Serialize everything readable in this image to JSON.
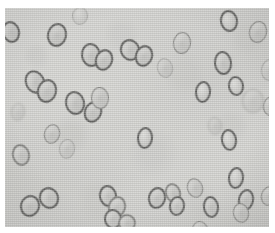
{
  "image": {
    "kind": "light-microscopy-micrograph",
    "subject": "ellipsoidal cells with dark refractive rims and pale centers, several in budding pairs",
    "width": 275,
    "height": 233,
    "canvas_background": "#ffffff"
  },
  "field": {
    "label": "specimen-field",
    "x": 5,
    "y": 8,
    "width": 264,
    "height": 219,
    "background_color": "#cdcdca",
    "highlight_color": "#d6d6d2",
    "shadow_color": "#c2c2bf",
    "texture": "horizontal-scan-lines"
  },
  "cell_style": {
    "rim_color": "#555553",
    "rim_color_soft": "#7c7c79",
    "rim_color_faint": "#9a9a97",
    "body_color": "#c6c6c3",
    "body_highlight": "#dcdcd9",
    "core_color": "#b6b6b3"
  },
  "cells": [
    {
      "id": "c01",
      "cx": 6,
      "cy": 24,
      "rx": 9,
      "ry": 11,
      "rot": -15,
      "rim": 2.0,
      "tone": "dark",
      "core": true
    },
    {
      "id": "c02",
      "cx": 52,
      "cy": 27,
      "rx": 10,
      "ry": 12,
      "rot": 12,
      "rim": 2.0,
      "tone": "dark",
      "core": true
    },
    {
      "id": "c03",
      "cx": 125,
      "cy": 42,
      "rx": 10,
      "ry": 11,
      "rot": -20,
      "rim": 2.0,
      "tone": "dark",
      "core": true
    },
    {
      "id": "c04",
      "cx": 139,
      "cy": 48,
      "rx": 9,
      "ry": 11,
      "rot": 18,
      "rim": 2.0,
      "tone": "dark",
      "core": true
    },
    {
      "id": "c05",
      "cx": 177,
      "cy": 35,
      "rx": 9,
      "ry": 11,
      "rot": 8,
      "rim": 1.8,
      "tone": "mid",
      "core": true
    },
    {
      "id": "c06",
      "cx": 224,
      "cy": 13,
      "rx": 9,
      "ry": 11,
      "rot": -10,
      "rim": 2.0,
      "tone": "dark",
      "core": false
    },
    {
      "id": "c07",
      "cx": 253,
      "cy": 24,
      "rx": 9,
      "ry": 11,
      "rot": 14,
      "rim": 1.8,
      "tone": "mid",
      "core": true
    },
    {
      "id": "c08",
      "cx": 86,
      "cy": 47,
      "rx": 10,
      "ry": 12,
      "rot": -8,
      "rim": 2.2,
      "tone": "dark",
      "core": true
    },
    {
      "id": "c09",
      "cx": 99,
      "cy": 52,
      "rx": 9,
      "ry": 11,
      "rot": 20,
      "rim": 2.0,
      "tone": "dark",
      "core": true
    },
    {
      "id": "c10",
      "cx": 218,
      "cy": 55,
      "rx": 9,
      "ry": 12,
      "rot": -6,
      "rim": 2.2,
      "tone": "dark",
      "core": true
    },
    {
      "id": "c11",
      "cx": 265,
      "cy": 62,
      "rx": 9,
      "ry": 11,
      "rot": 10,
      "rim": 1.6,
      "tone": "faint",
      "core": true
    },
    {
      "id": "c12",
      "cx": 30,
      "cy": 74,
      "rx": 10,
      "ry": 12,
      "rot": -25,
      "rim": 2.2,
      "tone": "dark",
      "core": true
    },
    {
      "id": "c13",
      "cx": 42,
      "cy": 83,
      "rx": 10,
      "ry": 12,
      "rot": 15,
      "rim": 2.2,
      "tone": "dark",
      "core": true
    },
    {
      "id": "c14",
      "cx": 70,
      "cy": 95,
      "rx": 10,
      "ry": 12,
      "rot": -12,
      "rim": 2.0,
      "tone": "dark",
      "core": true
    },
    {
      "id": "c15",
      "cx": 88,
      "cy": 104,
      "rx": 9,
      "ry": 11,
      "rot": 22,
      "rim": 2.0,
      "tone": "dark",
      "core": true
    },
    {
      "id": "c16",
      "cx": 95,
      "cy": 90,
      "rx": 9,
      "ry": 11,
      "rot": -5,
      "rim": 1.8,
      "tone": "mid",
      "core": true
    },
    {
      "id": "c17",
      "cx": 198,
      "cy": 84,
      "rx": 8,
      "ry": 11,
      "rot": 6,
      "rim": 2.0,
      "tone": "dark",
      "core": false
    },
    {
      "id": "c18",
      "cx": 231,
      "cy": 78,
      "rx": 8,
      "ry": 10,
      "rot": -8,
      "rim": 2.0,
      "tone": "dark",
      "core": false
    },
    {
      "id": "c19",
      "cx": 266,
      "cy": 98,
      "rx": 8,
      "ry": 10,
      "rot": 12,
      "rim": 1.8,
      "tone": "mid",
      "core": true
    },
    {
      "id": "c20",
      "cx": 140,
      "cy": 130,
      "rx": 8,
      "ry": 11,
      "rot": 5,
      "rim": 2.0,
      "tone": "dark",
      "core": false
    },
    {
      "id": "c21",
      "cx": 224,
      "cy": 132,
      "rx": 8,
      "ry": 11,
      "rot": -9,
      "rim": 2.0,
      "tone": "dark",
      "core": false
    },
    {
      "id": "c22",
      "cx": 47,
      "cy": 126,
      "rx": 8,
      "ry": 10,
      "rot": 16,
      "rim": 1.8,
      "tone": "mid",
      "core": true
    },
    {
      "id": "c23",
      "cx": 16,
      "cy": 147,
      "rx": 9,
      "ry": 11,
      "rot": -14,
      "rim": 2.0,
      "tone": "mid",
      "core": true
    },
    {
      "id": "c24",
      "cx": 231,
      "cy": 170,
      "rx": 8,
      "ry": 11,
      "rot": 7,
      "rim": 2.0,
      "tone": "dark",
      "core": false
    },
    {
      "id": "c25",
      "cx": 190,
      "cy": 180,
      "rx": 8,
      "ry": 10,
      "rot": -18,
      "rim": 1.8,
      "tone": "mid",
      "core": true
    },
    {
      "id": "c26",
      "cx": 44,
      "cy": 190,
      "rx": 10,
      "ry": 11,
      "rot": -22,
      "rim": 2.2,
      "tone": "dark",
      "core": true
    },
    {
      "id": "c27",
      "cx": 25,
      "cy": 198,
      "rx": 10,
      "ry": 11,
      "rot": 18,
      "rim": 2.2,
      "tone": "dark",
      "core": true
    },
    {
      "id": "c28",
      "cx": 103,
      "cy": 188,
      "rx": 9,
      "ry": 11,
      "rot": -10,
      "rim": 2.2,
      "tone": "dark",
      "core": true
    },
    {
      "id": "c29",
      "cx": 112,
      "cy": 199,
      "rx": 9,
      "ry": 11,
      "rot": 14,
      "rim": 2.0,
      "tone": "mid",
      "core": true
    },
    {
      "id": "c30",
      "cx": 108,
      "cy": 211,
      "rx": 9,
      "ry": 10,
      "rot": -6,
      "rim": 2.0,
      "tone": "dark",
      "core": true
    },
    {
      "id": "c31",
      "cx": 152,
      "cy": 190,
      "rx": 9,
      "ry": 11,
      "rot": 12,
      "rim": 2.2,
      "tone": "dark",
      "core": true
    },
    {
      "id": "c32",
      "cx": 168,
      "cy": 185,
      "rx": 8,
      "ry": 10,
      "rot": -16,
      "rim": 2.0,
      "tone": "mid",
      "core": true
    },
    {
      "id": "c33",
      "cx": 172,
      "cy": 198,
      "rx": 8,
      "ry": 10,
      "rot": 9,
      "rim": 2.0,
      "tone": "dark",
      "core": true
    },
    {
      "id": "c34",
      "cx": 206,
      "cy": 199,
      "rx": 8,
      "ry": 11,
      "rot": -7,
      "rim": 2.0,
      "tone": "dark",
      "core": true
    },
    {
      "id": "c35",
      "cx": 241,
      "cy": 192,
      "rx": 8,
      "ry": 11,
      "rot": 11,
      "rim": 2.0,
      "tone": "dark",
      "core": true
    },
    {
      "id": "c36",
      "cx": 236,
      "cy": 205,
      "rx": 8,
      "ry": 10,
      "rot": -12,
      "rim": 1.8,
      "tone": "mid",
      "core": true
    },
    {
      "id": "c37",
      "cx": 264,
      "cy": 188,
      "rx": 8,
      "ry": 10,
      "rot": 15,
      "rim": 1.8,
      "tone": "mid",
      "core": true
    },
    {
      "id": "c38",
      "cx": 122,
      "cy": 215,
      "rx": 9,
      "ry": 9,
      "rot": -20,
      "rim": 2.0,
      "tone": "mid",
      "core": true
    },
    {
      "id": "c39",
      "cx": 62,
      "cy": 141,
      "rx": 8,
      "ry": 10,
      "rot": 8,
      "rim": 1.6,
      "tone": "faint",
      "core": true
    },
    {
      "id": "c40",
      "cx": 160,
      "cy": 60,
      "rx": 8,
      "ry": 10,
      "rot": -12,
      "rim": 1.6,
      "tone": "faint",
      "core": true
    },
    {
      "id": "c41",
      "cx": 248,
      "cy": 93,
      "rx": 11,
      "ry": 12,
      "rot": 0,
      "rim": 1.4,
      "tone": "blur",
      "core": true
    },
    {
      "id": "c42",
      "cx": 13,
      "cy": 104,
      "rx": 7,
      "ry": 9,
      "rot": 10,
      "rim": 1.4,
      "tone": "blur",
      "core": true
    },
    {
      "id": "c43",
      "cx": 195,
      "cy": 222,
      "rx": 8,
      "ry": 9,
      "rot": -8,
      "rim": 1.8,
      "tone": "mid",
      "core": true
    },
    {
      "id": "c44",
      "cx": 75,
      "cy": 8,
      "rx": 8,
      "ry": 9,
      "rot": 6,
      "rim": 1.4,
      "tone": "faint",
      "core": false
    },
    {
      "id": "c45",
      "cx": 210,
      "cy": 118,
      "rx": 7,
      "ry": 9,
      "rot": -5,
      "rim": 1.4,
      "tone": "blur",
      "core": true
    }
  ]
}
